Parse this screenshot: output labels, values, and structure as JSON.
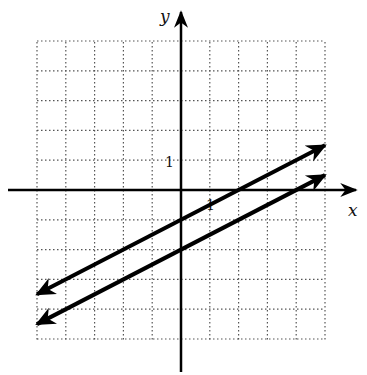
{
  "chart_data": {
    "type": "line",
    "title": "",
    "xlabel": "x",
    "ylabel": "y",
    "xlim": [
      -5,
      5
    ],
    "ylim": [
      -5,
      5
    ],
    "grid": true,
    "grid_style": "dotted",
    "tick_labels": {
      "x": [
        "1"
      ],
      "y": [
        "1"
      ]
    },
    "series": [
      {
        "name": "line-upper",
        "equation": "y = 0.5x - 1",
        "x": [
          -5,
          5
        ],
        "y": [
          -3.5,
          1.5
        ],
        "arrows": "both"
      },
      {
        "name": "line-lower",
        "equation": "y = 0.5x - 2",
        "x": [
          -5,
          5
        ],
        "y": [
          -4.5,
          0.5
        ],
        "arrows": "both"
      }
    ],
    "legend": null
  },
  "labels": {
    "x_axis": "x",
    "y_axis": "y",
    "x_tick": "1",
    "y_tick": "1"
  }
}
